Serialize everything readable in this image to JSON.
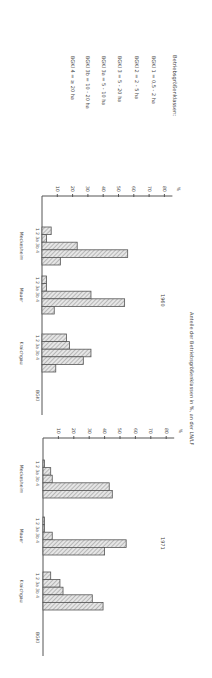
{
  "chart_data": [
    {
      "type": "bar",
      "orientation": "rotated-90-clockwise",
      "title": "Anteile der Betriebsgrößenklassen in %, an der LN/LF",
      "panel_label": "1960",
      "ylabel": "%",
      "xlabel": "BGKl",
      "ylim": [
        0,
        80
      ],
      "yticks": [
        10,
        20,
        30,
        40,
        50,
        60,
        70,
        80
      ],
      "categories": [
        "1",
        "2",
        "3a",
        "3b",
        "4"
      ],
      "groups": [
        {
          "name": "Meckesheim",
          "values": [
            6,
            3,
            23,
            56,
            12
          ]
        },
        {
          "name": "Mauer",
          "values": [
            3,
            3,
            32,
            54,
            8
          ]
        },
        {
          "name": "Kraichgau",
          "values": [
            16,
            18,
            32,
            27,
            9
          ]
        }
      ]
    },
    {
      "type": "bar",
      "orientation": "rotated-90-clockwise",
      "title": "Anteile der Betriebsgrößenklassen in %, an der LN/LF",
      "panel_label": "1971",
      "ylabel": "%",
      "xlabel": "BGKl",
      "ylim": [
        0,
        80
      ],
      "yticks": [
        10,
        20,
        30,
        40,
        50,
        60,
        70,
        80
      ],
      "categories": [
        "1",
        "2",
        "3a",
        "3b",
        "4"
      ],
      "groups": [
        {
          "name": "Meckesheim",
          "values": [
            1,
            5,
            6,
            43,
            45
          ]
        },
        {
          "name": "Mauer",
          "values": [
            1,
            1,
            6,
            54,
            40
          ]
        },
        {
          "name": "Kraichgau",
          "values": [
            5,
            11,
            13,
            32,
            39
          ]
        }
      ]
    }
  ],
  "legend": {
    "title": "Betriebsgrößenklassen:",
    "items": [
      "BGKl 1 = 0,5 - 2 ha",
      "BGKl 2 = 2 - 5 ha",
      "BGKl 3 = 5 - 20 ha",
      "BGKl 3a = 5 - 10 ha",
      "BGKl 3b = 10 - 20 ha",
      "BGKl 4 = ≥ 20 ha"
    ]
  },
  "category_axis_label": "1  2  3a 3b 4"
}
